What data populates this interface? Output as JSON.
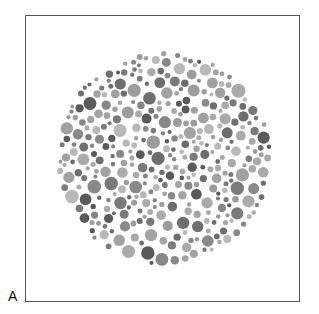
{
  "figure": {
    "panel_label": "A",
    "plate": {
      "center": [
        164,
        158
      ],
      "radius": 108,
      "dot_colors": [
        "#5a5a5a",
        "#6e6e6e",
        "#888888",
        "#9c9c9c",
        "#aaaaaa",
        "#b8b8b8",
        "#7a7a7a",
        "#a2a2a2"
      ]
    },
    "frame_color": "#555555",
    "background": "#ffffff"
  }
}
